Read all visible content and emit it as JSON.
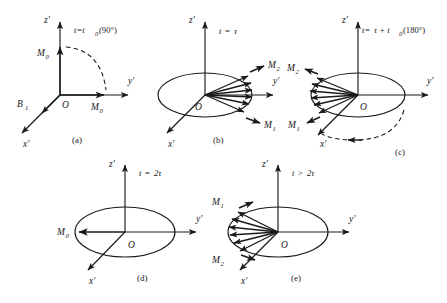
{
  "figure": {
    "type": "diagram",
    "background": "#ffffff",
    "stroke": "#1a1a1a"
  },
  "axes": {
    "z": "z'",
    "y": "y'",
    "x": "x'",
    "origin": "O"
  },
  "panels": [
    {
      "id": "(a)",
      "time_label": "t=t",
      "time_sub": "0",
      "time_tail": "(90°)",
      "vectors": [
        {
          "name": "M",
          "sub": "0",
          "direction": "up-z"
        },
        {
          "name": "M",
          "sub": "0",
          "direction": "along-y"
        },
        {
          "name": "B",
          "sub": "1",
          "direction": "along-x"
        }
      ],
      "dashed_arc": true,
      "ellipse": false
    },
    {
      "id": "(b)",
      "time_label": "t",
      "time_eq": "=",
      "time_tail": "τ",
      "vectors": [
        {
          "name": "M",
          "sub": "2",
          "direction": "fan-upper"
        },
        {
          "name": "M",
          "sub": "1",
          "direction": "fan-lower"
        }
      ],
      "fan_count": 6,
      "dashed_arc": false,
      "ellipse": true
    },
    {
      "id": "(c)",
      "time_label": "t",
      "time_eq": "=",
      "time_tail": "τ + t",
      "time_sub": "0",
      "time_tail2": "(180°)",
      "vectors": [
        {
          "name": "M",
          "sub": "2",
          "direction": "fan-upper-left"
        },
        {
          "name": "M",
          "sub": "1",
          "direction": "fan-lower-left"
        }
      ],
      "fan_count": 6,
      "dashed_arc": true,
      "ellipse": true
    },
    {
      "id": "(d)",
      "time_label": "t",
      "time_eq": "=",
      "time_tail": "2τ",
      "vectors": [
        {
          "name": "M",
          "sub": "0",
          "direction": "negative-y"
        }
      ],
      "dashed_arc": false,
      "ellipse": true
    },
    {
      "id": "(e)",
      "time_label": "t",
      "time_eq": ">",
      "time_tail": "2τ",
      "vectors": [
        {
          "name": "M",
          "sub": "1",
          "direction": "fan-upper-left"
        },
        {
          "name": "M",
          "sub": "2",
          "direction": "fan-lower-left"
        }
      ],
      "fan_count": 6,
      "dashed_arc": false,
      "ellipse": true
    }
  ],
  "labels": {
    "a_id": "(a)",
    "b_id": "(b)",
    "c_id": "(c)",
    "d_id": "(d)",
    "e_id": "(e)",
    "zp": "z'",
    "yp": "y'",
    "xp": "x'",
    "O": "O",
    "M": "M",
    "B": "B",
    "s0": "0",
    "s1": "1",
    "s2": "2",
    "t": "t",
    "eq": "=",
    "gt": ">",
    "tau": "τ",
    "two_tau": "2τ",
    "a_time_head": "t=t",
    "a_time_tail": "(90°)",
    "c_time_head": "t=",
    "c_time_mid": "τ + t",
    "c_time_tail": "(180°)"
  }
}
